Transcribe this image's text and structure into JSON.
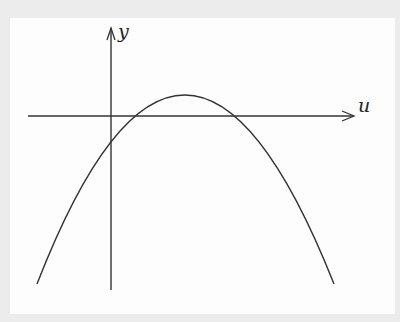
{
  "diagram": {
    "title": "",
    "axes": {
      "x_label": "u",
      "y_label": "y"
    },
    "curve": {
      "type": "downward parabola",
      "description": "Parabola opening downward, passing through the origin, vertex in first quadrant, second root on positive u-axis"
    },
    "colors": {
      "background": "#ececec",
      "panel": "#fdfdfd",
      "stroke": "#333333"
    }
  }
}
